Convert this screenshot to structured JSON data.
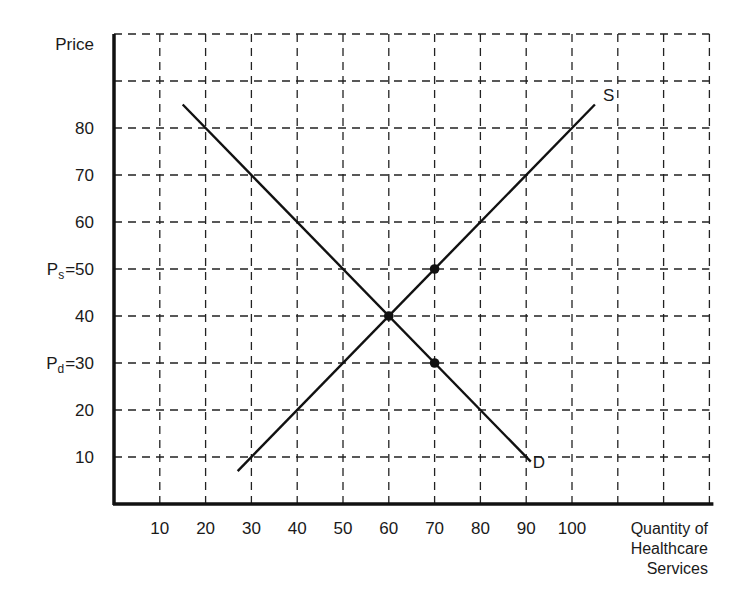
{
  "chart_data": {
    "type": "line",
    "title": "",
    "ylabel": "Price",
    "xlabel": [
      "Quantity of",
      "Healthcare",
      "Services"
    ],
    "xlim": [
      0,
      130
    ],
    "ylim": [
      0,
      100
    ],
    "grid": true,
    "grid_style": "dashed",
    "x_gridlines": [
      10,
      20,
      30,
      40,
      50,
      60,
      70,
      80,
      90,
      100,
      110,
      120,
      130
    ],
    "y_gridlines": [
      10,
      20,
      30,
      40,
      50,
      60,
      70,
      80,
      90,
      100
    ],
    "x_tick_labels": [
      {
        "value": 10,
        "label": "10"
      },
      {
        "value": 20,
        "label": "20"
      },
      {
        "value": 30,
        "label": "30"
      },
      {
        "value": 40,
        "label": "40"
      },
      {
        "value": 50,
        "label": "50"
      },
      {
        "value": 60,
        "label": "60"
      },
      {
        "value": 70,
        "label": "70"
      },
      {
        "value": 80,
        "label": "80"
      },
      {
        "value": 90,
        "label": "90"
      },
      {
        "value": 100,
        "label": "100"
      }
    ],
    "y_tick_labels": [
      {
        "value": 10,
        "label": "10"
      },
      {
        "value": 20,
        "label": "20"
      },
      {
        "value": 30,
        "label": "30",
        "prefix": "P",
        "sub": "d",
        "eq": "="
      },
      {
        "value": 40,
        "label": "40"
      },
      {
        "value": 50,
        "label": "50",
        "prefix": "P",
        "sub": "s",
        "eq": "="
      },
      {
        "value": 60,
        "label": "60"
      },
      {
        "value": 70,
        "label": "70"
      },
      {
        "value": 80,
        "label": "80"
      }
    ],
    "series": [
      {
        "name": "S",
        "label": "S",
        "points": [
          [
            27,
            7
          ],
          [
            105,
            85
          ]
        ]
      },
      {
        "name": "D",
        "label": "D",
        "points": [
          [
            15,
            85
          ],
          [
            91,
            9
          ]
        ]
      }
    ],
    "markers": [
      {
        "x": 60,
        "y": 40,
        "note": "equilibrium"
      },
      {
        "x": 70,
        "y": 50,
        "note": "Ps"
      },
      {
        "x": 70,
        "y": 30,
        "note": "Pd"
      }
    ],
    "legend": "none"
  }
}
